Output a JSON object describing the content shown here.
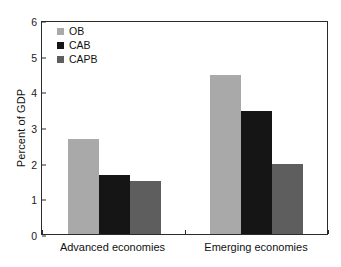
{
  "chart_data": {
    "type": "bar",
    "title": "",
    "subtitle": "",
    "xlabel": "",
    "ylabel": "Percent of GDP",
    "categories": [
      "Advanced economies",
      "Emerging economies"
    ],
    "series": [
      {
        "name": "OB",
        "values": [
          2.66,
          4.45
        ],
        "color": "#a9a9a9"
      },
      {
        "name": "CAB",
        "values": [
          1.65,
          3.45
        ],
        "color": "#151515"
      },
      {
        "name": "CAPB",
        "values": [
          1.48,
          1.96
        ],
        "color": "#5e5e5e"
      }
    ],
    "ylim": [
      0,
      6
    ],
    "yticks": [
      0,
      1,
      2,
      3,
      4,
      5,
      6
    ],
    "ytick_labels": [
      "0",
      "1",
      "2",
      "3",
      "4",
      "5",
      "6"
    ],
    "grid": false,
    "legend_position": "upper-left-inside",
    "frame": true,
    "annotations": []
  },
  "legend": {
    "entries": [
      {
        "label": "OB",
        "color": "#a9a9a9"
      },
      {
        "label": "CAB",
        "color": "#151515"
      },
      {
        "label": "CAPB",
        "color": "#5e5e5e"
      }
    ]
  },
  "axis": {
    "y_title": "Percent of GDP",
    "y_tick_labels": [
      "6",
      "5",
      "4",
      "3",
      "2",
      "1",
      "0"
    ],
    "x_group_labels": [
      "Advanced economies",
      "Emerging economies"
    ]
  },
  "colors": {
    "ob": "#a9a9a9",
    "cab": "#151515",
    "capb": "#5e5e5e",
    "axis": "#2b2b2b",
    "text": "#111111",
    "background": "#ffffff"
  }
}
